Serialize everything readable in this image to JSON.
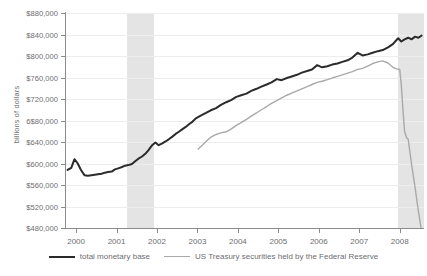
{
  "chart_data": {
    "type": "line",
    "title": "",
    "xlabel": "",
    "ylabel": "billions of dollars",
    "xlim": [
      1999.75,
      2008.6
    ],
    "ylim": [
      480000,
      880000
    ],
    "ytick_labels": [
      "$880,000",
      "$840,000",
      "$800,000",
      "$760,000",
      "$720,000",
      "6$80,000",
      "$640,000",
      "$600,000",
      "$560,000",
      "$520,000",
      "$480,000"
    ],
    "ytick_values": [
      880000,
      840000,
      800000,
      760000,
      720000,
      680000,
      640000,
      600000,
      560000,
      520000,
      480000
    ],
    "xtick_labels": [
      "2000",
      "2001",
      "2002",
      "2003",
      "2004",
      "2005",
      "2006",
      "2007",
      "2008"
    ],
    "xtick_values": [
      2000,
      2001,
      2002,
      2003,
      2004,
      2005,
      2006,
      2007,
      2008
    ],
    "grid": true,
    "legend_position": "bottom",
    "shaded_regions": [
      {
        "name": "recession-2001",
        "x0": 2001.25,
        "x1": 2001.92
      },
      {
        "name": "recession-2008",
        "x0": 2007.95,
        "x1": 2008.6
      }
    ],
    "series": [
      {
        "name": "total monetary base",
        "color": "#2b2b2b",
        "width": 2,
        "points": [
          [
            1999.79,
            588000
          ],
          [
            1999.88,
            592000
          ],
          [
            1999.96,
            608000
          ],
          [
            2000.04,
            600000
          ],
          [
            2000.12,
            588000
          ],
          [
            2000.21,
            578000
          ],
          [
            2000.29,
            577000
          ],
          [
            2000.38,
            578000
          ],
          [
            2000.46,
            579000
          ],
          [
            2000.54,
            580000
          ],
          [
            2000.63,
            581000
          ],
          [
            2000.71,
            583000
          ],
          [
            2000.79,
            584000
          ],
          [
            2000.88,
            585000
          ],
          [
            2000.96,
            589000
          ],
          [
            2001.04,
            591000
          ],
          [
            2001.12,
            593000
          ],
          [
            2001.21,
            596000
          ],
          [
            2001.29,
            597000
          ],
          [
            2001.38,
            599000
          ],
          [
            2001.46,
            604000
          ],
          [
            2001.54,
            609000
          ],
          [
            2001.63,
            613000
          ],
          [
            2001.71,
            618000
          ],
          [
            2001.79,
            625000
          ],
          [
            2001.88,
            634000
          ],
          [
            2001.96,
            639000
          ],
          [
            2002.04,
            634000
          ],
          [
            2002.12,
            637000
          ],
          [
            2002.21,
            641000
          ],
          [
            2002.29,
            645000
          ],
          [
            2002.38,
            650000
          ],
          [
            2002.46,
            655000
          ],
          [
            2002.54,
            659000
          ],
          [
            2002.63,
            664000
          ],
          [
            2002.71,
            668000
          ],
          [
            2002.79,
            673000
          ],
          [
            2002.88,
            678000
          ],
          [
            2002.96,
            684000
          ],
          [
            2003.08,
            689000
          ],
          [
            2003.21,
            694000
          ],
          [
            2003.33,
            699000
          ],
          [
            2003.46,
            703000
          ],
          [
            2003.58,
            709000
          ],
          [
            2003.71,
            714000
          ],
          [
            2003.83,
            718000
          ],
          [
            2003.96,
            724000
          ],
          [
            2004.08,
            727000
          ],
          [
            2004.21,
            730000
          ],
          [
            2004.33,
            735000
          ],
          [
            2004.46,
            739000
          ],
          [
            2004.58,
            743000
          ],
          [
            2004.71,
            747000
          ],
          [
            2004.83,
            751000
          ],
          [
            2004.96,
            757000
          ],
          [
            2005.08,
            755000
          ],
          [
            2005.21,
            759000
          ],
          [
            2005.33,
            762000
          ],
          [
            2005.46,
            765000
          ],
          [
            2005.58,
            769000
          ],
          [
            2005.71,
            772000
          ],
          [
            2005.83,
            775000
          ],
          [
            2005.96,
            783000
          ],
          [
            2006.08,
            779000
          ],
          [
            2006.21,
            781000
          ],
          [
            2006.33,
            784000
          ],
          [
            2006.46,
            786000
          ],
          [
            2006.58,
            789000
          ],
          [
            2006.71,
            792000
          ],
          [
            2006.83,
            797000
          ],
          [
            2006.96,
            806000
          ],
          [
            2007.08,
            801000
          ],
          [
            2007.21,
            803000
          ],
          [
            2007.33,
            806000
          ],
          [
            2007.46,
            809000
          ],
          [
            2007.58,
            811000
          ],
          [
            2007.71,
            816000
          ],
          [
            2007.83,
            822000
          ],
          [
            2007.96,
            833000
          ],
          [
            2008.04,
            827000
          ],
          [
            2008.12,
            831000
          ],
          [
            2008.21,
            834000
          ],
          [
            2008.29,
            831000
          ],
          [
            2008.38,
            836000
          ],
          [
            2008.46,
            834000
          ],
          [
            2008.54,
            838000
          ]
        ]
      },
      {
        "name": "US Treasury securities held by the Federal Reserve",
        "color": "#a8a9ab",
        "width": 1.4,
        "points": [
          [
            2003.02,
            627000
          ],
          [
            2003.12,
            634000
          ],
          [
            2003.21,
            641000
          ],
          [
            2003.33,
            649000
          ],
          [
            2003.46,
            654000
          ],
          [
            2003.58,
            657000
          ],
          [
            2003.71,
            659000
          ],
          [
            2003.83,
            664000
          ],
          [
            2003.96,
            671000
          ],
          [
            2004.08,
            676000
          ],
          [
            2004.21,
            682000
          ],
          [
            2004.33,
            688000
          ],
          [
            2004.46,
            694000
          ],
          [
            2004.58,
            700000
          ],
          [
            2004.71,
            706000
          ],
          [
            2004.83,
            712000
          ],
          [
            2004.96,
            717000
          ],
          [
            2005.08,
            722000
          ],
          [
            2005.21,
            727000
          ],
          [
            2005.33,
            731000
          ],
          [
            2005.46,
            735000
          ],
          [
            2005.58,
            739000
          ],
          [
            2005.71,
            743000
          ],
          [
            2005.83,
            747000
          ],
          [
            2005.96,
            751000
          ],
          [
            2006.08,
            753000
          ],
          [
            2006.21,
            756000
          ],
          [
            2006.33,
            759000
          ],
          [
            2006.46,
            762000
          ],
          [
            2006.58,
            765000
          ],
          [
            2006.71,
            768000
          ],
          [
            2006.83,
            771000
          ],
          [
            2006.96,
            775000
          ],
          [
            2007.08,
            777000
          ],
          [
            2007.21,
            781000
          ],
          [
            2007.33,
            786000
          ],
          [
            2007.46,
            789000
          ],
          [
            2007.58,
            791000
          ],
          [
            2007.71,
            787000
          ],
          [
            2007.83,
            779000
          ],
          [
            2007.92,
            776000
          ],
          [
            2008.0,
            775000
          ],
          [
            2008.04,
            745000
          ],
          [
            2008.08,
            700000
          ],
          [
            2008.12,
            660000
          ],
          [
            2008.17,
            648000
          ],
          [
            2008.21,
            645000
          ],
          [
            2008.29,
            600000
          ],
          [
            2008.38,
            555000
          ],
          [
            2008.46,
            512000
          ],
          [
            2008.54,
            474000
          ]
        ]
      }
    ],
    "legend": [
      {
        "label": "total monetary base",
        "marker": "dark-line"
      },
      {
        "label": "US Treasury securities held by the Federal Reserve",
        "marker": "light-line"
      }
    ]
  }
}
